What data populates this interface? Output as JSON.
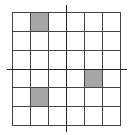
{
  "diagram": {
    "type": "coordinate-grid",
    "rows": 6,
    "cols": 6,
    "shaded_color": "#a6a6a6",
    "line_color": "#444444",
    "shaded_cells": [
      {
        "row": 0,
        "col": 1
      },
      {
        "row": 3,
        "col": 4
      },
      {
        "row": 4,
        "col": 1
      }
    ],
    "axes": {
      "horizontal": true,
      "vertical": true
    }
  }
}
